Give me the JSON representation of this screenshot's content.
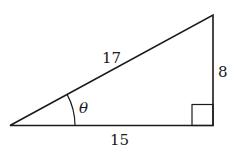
{
  "diagram": {
    "type": "right-triangle",
    "labels": {
      "hypotenuse": "17",
      "opposite": "8",
      "adjacent": "15",
      "angle": "θ"
    },
    "colors": {
      "stroke": "#1a1a1a",
      "background": "#ffffff"
    }
  }
}
